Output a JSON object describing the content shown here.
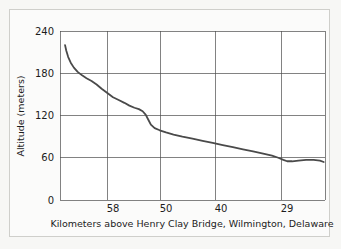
{
  "figure": {
    "background_color": "#f7f7f5",
    "panel_color": "#fbfbfa",
    "border_color": "#cfcfcb"
  },
  "chart_data": {
    "type": "line",
    "title": "",
    "subtitle": "",
    "xlabel": "Kilometers above Henry Clay Bridge, Wilmington, Delaware",
    "ylabel": "Altitude (meters)",
    "grid": true,
    "legend": null,
    "legend_position": "none",
    "line_color": "#4a4a4a",
    "line_width": 1.8,
    "x_axis": {
      "tick_labels": [
        "58",
        "50",
        "40",
        "29"
      ],
      "tick_values": [
        58,
        50,
        40,
        29
      ],
      "direction": "decreasing",
      "xlim": [
        64,
        22
      ]
    },
    "y_axis": {
      "tick_labels": [
        "0",
        "60",
        "120",
        "180",
        "240"
      ],
      "tick_values": [
        0,
        60,
        120,
        180,
        240
      ],
      "ylim": [
        0,
        240
      ]
    },
    "series": [
      {
        "name": "Altitude profile",
        "x": [
          63.2,
          63.0,
          62.7,
          62.3,
          61.8,
          61.2,
          60.5,
          59.8,
          59.0,
          58.2,
          57.4,
          56.5,
          55.6,
          54.7,
          53.8,
          53.0,
          52.2,
          51.5,
          50.9,
          50.4,
          50.0,
          49.6,
          49.0,
          48.2,
          47.2,
          46.0,
          44.6,
          43.0,
          41.4,
          39.8,
          38.2,
          36.6,
          35.0,
          33.4,
          31.8,
          30.4,
          29.4,
          28.6,
          28.0,
          27.2,
          26.2,
          25.0,
          23.8,
          22.8,
          22.2
        ],
        "y": [
          220,
          212,
          203,
          195,
          188,
          182,
          177,
          173,
          169,
          164,
          158,
          152,
          146,
          142,
          138,
          134,
          131,
          129,
          126,
          121,
          114,
          107,
          102,
          99,
          96,
          93,
          90,
          87,
          84,
          81,
          78,
          75,
          72,
          69,
          66,
          63,
          60,
          57,
          55,
          55,
          56,
          57,
          57,
          56,
          54
        ]
      }
    ],
    "annotations": []
  }
}
